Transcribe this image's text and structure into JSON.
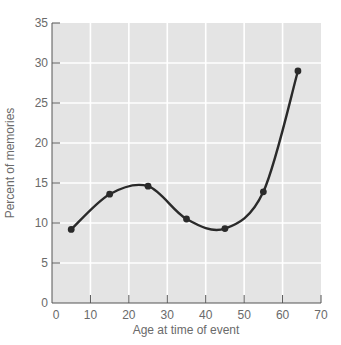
{
  "chart_data": {
    "type": "line",
    "title": "",
    "xlabel": "Age at time of event",
    "ylabel": "Percent of memories",
    "xlim": [
      0,
      70
    ],
    "ylim": [
      0,
      35
    ],
    "xticks": [
      0,
      10,
      20,
      30,
      40,
      50,
      60,
      70
    ],
    "yticks": [
      0,
      5,
      10,
      15,
      20,
      25,
      30,
      35
    ],
    "grid": true,
    "legend": null,
    "series": [
      {
        "name": "Percent of memories",
        "x": [
          5,
          15,
          25,
          35,
          45,
          55,
          64
        ],
        "y": [
          9.2,
          13.6,
          14.6,
          10.5,
          9.3,
          13.9,
          29.0
        ],
        "style": "smooth line with markers"
      }
    ]
  },
  "colors": {
    "plot_background": "#e4e4e4",
    "grid": "#ffffff",
    "line": "#2a2a2a",
    "axis": "#555555",
    "text": "#6a6a6a"
  }
}
